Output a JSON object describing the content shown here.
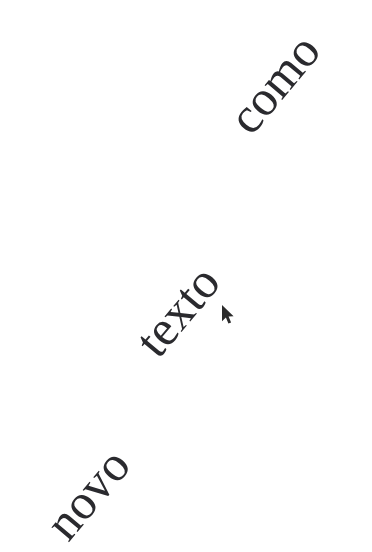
{
  "canvas": {
    "width": 372,
    "height": 552,
    "background_color": "#ffffff",
    "text_color": "#2a2a2e"
  },
  "text_objects": [
    {
      "id": "word-novo",
      "text": "novo",
      "x": 36,
      "y": 516,
      "rotation_deg": -50,
      "font_size_px": 50,
      "color": "#2a2a2e"
    },
    {
      "id": "word-texto",
      "text": "texto",
      "x": 126,
      "y": 333,
      "rotation_deg": -50,
      "font_size_px": 50,
      "color": "#2a2a2e"
    },
    {
      "id": "word-como",
      "text": "como",
      "x": 219,
      "y": 110,
      "rotation_deg": -50,
      "font_size_px": 50,
      "color": "#2a2a2e"
    }
  ],
  "cursor": {
    "icon": "arrow-pointer-cursor",
    "x": 222,
    "y": 305,
    "color": "#2b2b2b"
  }
}
